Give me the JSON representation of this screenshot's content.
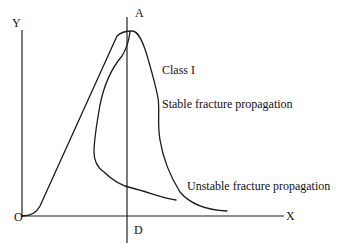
{
  "diagram": {
    "axes": {
      "y_label": "Y",
      "x_label": "X",
      "origin_label": "O"
    },
    "vertical_line": {
      "top_label": "A",
      "bottom_label": "D"
    },
    "annotations": {
      "class": "Class I",
      "stable": "Stable fracture propagation",
      "unstable": "Unstable fracture propagation"
    }
  }
}
